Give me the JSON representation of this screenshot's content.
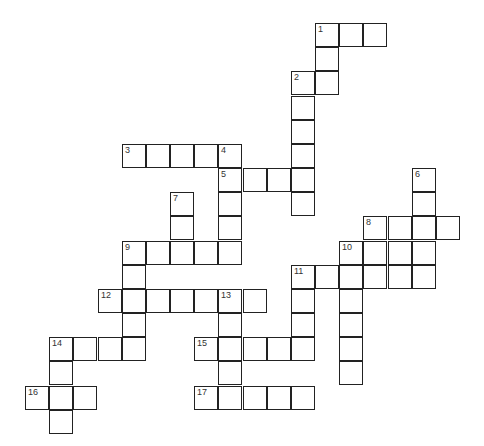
{
  "puzzle": {
    "type": "crossword",
    "cell_size": 24.17,
    "origin": {
      "x": 25,
      "y": 23
    },
    "entries": [
      {
        "number": 1,
        "direction": "across",
        "row": 0,
        "col": 12,
        "length": 3
      },
      {
        "number": 1,
        "direction": "down",
        "row": 0,
        "col": 12,
        "length": 3
      },
      {
        "number": 2,
        "direction": "down",
        "row": 2,
        "col": 11,
        "length": 6
      },
      {
        "number": 3,
        "direction": "across",
        "row": 5,
        "col": 4,
        "length": 5
      },
      {
        "number": 4,
        "direction": "down",
        "row": 5,
        "col": 8,
        "length": 5
      },
      {
        "number": 5,
        "direction": "across",
        "row": 6,
        "col": 8,
        "length": 4
      },
      {
        "number": 6,
        "direction": "down",
        "row": 6,
        "col": 16,
        "length": 5
      },
      {
        "number": 7,
        "direction": "down",
        "row": 7,
        "col": 6,
        "length": 3
      },
      {
        "number": 8,
        "direction": "across",
        "row": 8,
        "col": 14,
        "length": 4
      },
      {
        "number": 9,
        "direction": "across",
        "row": 9,
        "col": 4,
        "length": 5
      },
      {
        "number": 9,
        "direction": "down",
        "row": 9,
        "col": 4,
        "length": 5
      },
      {
        "number": 10,
        "direction": "down",
        "row": 9,
        "col": 13,
        "length": 6
      },
      {
        "number": 11,
        "direction": "across",
        "row": 10,
        "col": 11,
        "length": 6
      },
      {
        "number": 11,
        "direction": "down",
        "row": 10,
        "col": 11,
        "length": 4
      },
      {
        "number": 12,
        "direction": "across",
        "row": 11,
        "col": 3,
        "length": 7
      },
      {
        "number": 13,
        "direction": "down",
        "row": 11,
        "col": 8,
        "length": 5
      },
      {
        "number": 14,
        "direction": "across",
        "row": 13,
        "col": 1,
        "length": 4
      },
      {
        "number": 14,
        "direction": "down",
        "row": 13,
        "col": 1,
        "length": 4
      },
      {
        "number": 15,
        "direction": "across",
        "row": 13,
        "col": 7,
        "length": 5
      },
      {
        "number": 16,
        "direction": "across",
        "row": 15,
        "col": 0,
        "length": 3
      },
      {
        "number": 17,
        "direction": "across",
        "row": 15,
        "col": 7,
        "length": 5
      }
    ],
    "extra_cells": [
      {
        "row": 9,
        "col": 14
      },
      {
        "row": 9,
        "col": 15
      }
    ]
  }
}
